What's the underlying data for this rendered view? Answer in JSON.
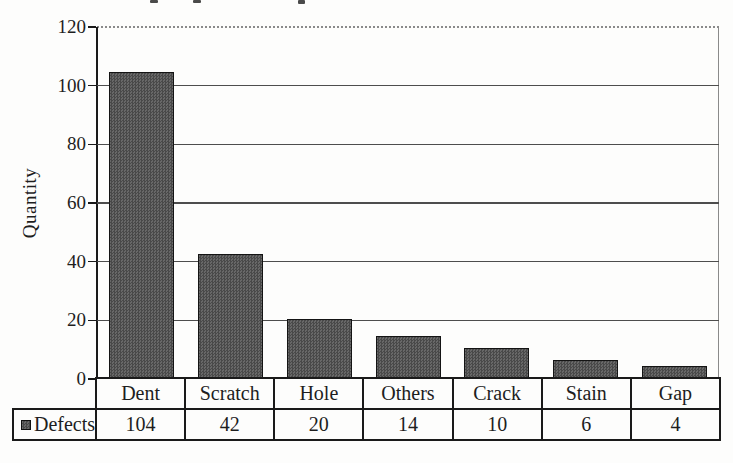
{
  "chart_data": {
    "type": "bar",
    "title": "",
    "xlabel": "",
    "ylabel": "Quantity",
    "categories": [
      "Dent",
      "Scratch",
      "Hole",
      "Others",
      "Crack",
      "Stain",
      "Gap"
    ],
    "series": [
      {
        "name": "Defects",
        "values": [
          104,
          42,
          20,
          14,
          10,
          6,
          4
        ]
      }
    ],
    "ylim": [
      0,
      120
    ],
    "yticks": [
      0,
      20,
      40,
      60,
      80,
      100,
      120
    ],
    "grid": "horizontal gridlines at every 20 units, dotted top border at 120",
    "legend_position": "bottom data-table row with swatch",
    "data_table": {
      "row_label": "Defects",
      "values": [
        104,
        42,
        20,
        14,
        10,
        6,
        4
      ]
    },
    "colors": {
      "bar_fill": "#5a5a5a",
      "bar_border": "#141414",
      "gridline": "#4d4d4d",
      "axis": "#1a1a1a",
      "table_border": "#1a1a1a",
      "text": "#1e1e1e",
      "background": "#fdfdfc"
    }
  }
}
